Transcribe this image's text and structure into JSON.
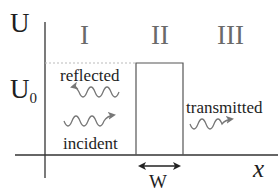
{
  "diagram": {
    "type": "potential-barrier",
    "axes": {
      "y_label": "U",
      "x_label": "x",
      "level_label": "U",
      "level_subscript": "0"
    },
    "regions": [
      {
        "label": "I"
      },
      {
        "label": "II"
      },
      {
        "label": "III"
      }
    ],
    "waves": {
      "reflected": "reflected",
      "incident": "incident",
      "transmitted": "transmitted"
    },
    "width_label": "W",
    "colors": {
      "axis": "#333333",
      "barrier": "#555555",
      "dashed": "#bbbbbb",
      "wave": "#777777",
      "region_label": "#6a6a6a"
    }
  }
}
